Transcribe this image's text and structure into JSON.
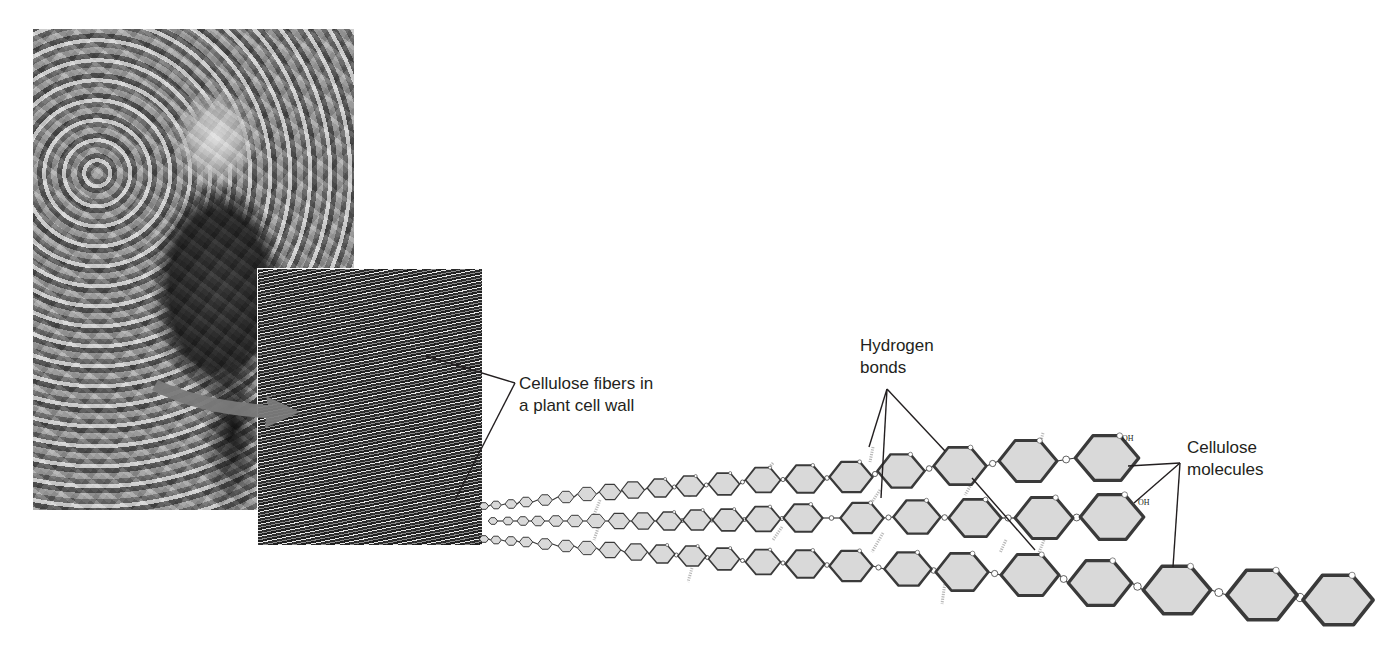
{
  "figure": {
    "photos": {
      "child_photo": {
        "description": "Black-and-white photo of a child holding leaves in autumn foliage"
      },
      "micrograph": {
        "description": "Electron micrograph of cellulose fibers"
      }
    },
    "labels": {
      "fibers": {
        "line1": "Cellulose fibers in",
        "line2": "a plant cell wall"
      },
      "hbonds": {
        "line1": "Hydrogen",
        "line2": "bonds"
      },
      "molecules": {
        "line1": "Cellulose",
        "line2": "molecules"
      },
      "oh_top": "OH",
      "oh_mid": "OH"
    },
    "colors": {
      "ring_fill": "#d9d9d9",
      "ring_stroke": "#3a3a3a",
      "hbond": "#b8b8b8",
      "leader": "#231f20",
      "arrow": "#7a7a7a"
    },
    "chains": [
      {
        "name": "top",
        "rings": [
          [
            484,
            506,
            3.5
          ],
          [
            496,
            505,
            4
          ],
          [
            511,
            504,
            4.5
          ],
          [
            526,
            502,
            5
          ],
          [
            545,
            500,
            5.5
          ],
          [
            566,
            497,
            6
          ],
          [
            587,
            494,
            7
          ],
          [
            610,
            492,
            8
          ],
          [
            633,
            490,
            8.5
          ],
          [
            660,
            488,
            9.5
          ],
          [
            690,
            486,
            10.5
          ],
          [
            724,
            484,
            11.5
          ],
          [
            763,
            480,
            13
          ],
          [
            805,
            479,
            14.5
          ],
          [
            851,
            477,
            16
          ],
          [
            901,
            471,
            17.5
          ],
          [
            960,
            466,
            19.5
          ],
          [
            1028,
            461,
            21.5
          ],
          [
            1107,
            458,
            23.5
          ]
        ]
      },
      {
        "name": "middle",
        "rings": [
          [
            493,
            521,
            3.5
          ],
          [
            508,
            521,
            4
          ],
          [
            523,
            521,
            4.5
          ],
          [
            538,
            521,
            5
          ],
          [
            556,
            521,
            5.5
          ],
          [
            575,
            521,
            6
          ],
          [
            596,
            521,
            7
          ],
          [
            619,
            521,
            8
          ],
          [
            643,
            521,
            8.5
          ],
          [
            669,
            521,
            9.5
          ],
          [
            697,
            520,
            10.5
          ],
          [
            728,
            520,
            11.5
          ],
          [
            763,
            519,
            13
          ],
          [
            803,
            518,
            14.5
          ],
          [
            862,
            518,
            16
          ],
          [
            917,
            517,
            17.5
          ],
          [
            975,
            518,
            19.5
          ],
          [
            1044,
            518,
            21.5
          ],
          [
            1112,
            517,
            23.5
          ]
        ]
      },
      {
        "name": "bottom",
        "rings": [
          [
            484,
            539,
            3.5
          ],
          [
            496,
            540,
            4
          ],
          [
            511,
            541,
            4.5
          ],
          [
            526,
            542,
            5
          ],
          [
            545,
            544,
            5.5
          ],
          [
            566,
            546,
            6
          ],
          [
            587,
            548,
            7
          ],
          [
            610,
            550,
            8
          ],
          [
            636,
            552,
            8.5
          ],
          [
            662,
            554,
            9.5
          ],
          [
            692,
            556,
            10.5
          ],
          [
            724,
            559,
            11.5
          ],
          [
            763,
            562,
            13
          ],
          [
            805,
            564,
            14.5
          ],
          [
            851,
            566,
            16
          ],
          [
            908,
            569,
            17.5
          ],
          [
            962,
            572,
            19.5
          ],
          [
            1030,
            575,
            21.5
          ],
          [
            1100,
            583,
            23.5
          ],
          [
            1177,
            590,
            25
          ],
          [
            1262,
            595,
            26
          ],
          [
            1338,
            600,
            26
          ]
        ]
      }
    ],
    "hbonds": [
      [
        600,
        500,
        594,
        515
      ],
      [
        598,
        528,
        594,
        540
      ],
      [
        773,
        463,
        767,
        470
      ],
      [
        782,
        527,
        773,
        540
      ],
      [
        873,
        447,
        870,
        462
      ],
      [
        880,
        490,
        870,
        505
      ],
      [
        883,
        533,
        872,
        552
      ],
      [
        975,
        478,
        965,
        495
      ],
      [
        1006,
        540,
        1000,
        553
      ],
      [
        1043,
        433,
        1038,
        452
      ],
      [
        1044,
        540,
        1036,
        560
      ],
      [
        945,
        582,
        942,
        604
      ],
      [
        692,
        568,
        688,
        582
      ],
      [
        690,
        497,
        688,
        485
      ]
    ],
    "leaders": {
      "fibers": [
        [
          [
            515,
            383
          ],
          [
            426,
            356
          ]
        ],
        [
          [
            515,
            383
          ],
          [
            455,
            500
          ]
        ]
      ],
      "hbonds": [
        [
          [
            887,
            389
          ],
          [
            869,
            447
          ]
        ],
        [
          [
            887,
            389
          ],
          [
            881,
            498
          ]
        ],
        [
          [
            887,
            389
          ],
          [
            945,
            451
          ]
        ],
        [
          [
            972,
            478
          ],
          [
            1035,
            550
          ]
        ]
      ],
      "molecules": [
        [
          [
            1180,
            463
          ],
          [
            1128,
            466
          ]
        ],
        [
          [
            1180,
            463
          ],
          [
            1134,
            503
          ]
        ],
        [
          [
            1180,
            463
          ],
          [
            1173,
            567
          ]
        ]
      ]
    }
  }
}
